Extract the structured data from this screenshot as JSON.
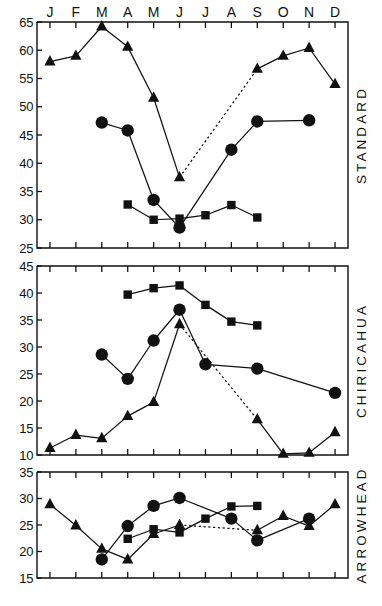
{
  "figure": {
    "months": [
      "J",
      "F",
      "M",
      "A",
      "M",
      "J",
      "J",
      "A",
      "S",
      "O",
      "N",
      "D"
    ],
    "month_axis_position": "top"
  },
  "chart_data": [
    {
      "type": "line",
      "title": "STANDARD",
      "panel_label": "STANDARD",
      "xlabel": "",
      "ylabel": "",
      "categories": [
        "J",
        "F",
        "M",
        "A",
        "M",
        "J",
        "J",
        "A",
        "S",
        "O",
        "N",
        "D"
      ],
      "ylim": [
        25,
        65
      ],
      "yticks": [
        25,
        30,
        35,
        40,
        45,
        50,
        55,
        60,
        65
      ],
      "grid": false,
      "legend": "none",
      "series": [
        {
          "name": "triangle",
          "marker": "triangle",
          "x": [
            "J",
            "F",
            "M",
            "A",
            "M",
            "J",
            "S",
            "O",
            "N",
            "D"
          ],
          "values": [
            58.0,
            59.0,
            64.2,
            60.6,
            51.6,
            37.5,
            56.7,
            59.0,
            60.4,
            54.0
          ],
          "dashed_segments": [
            [
              "J",
              "S"
            ]
          ]
        },
        {
          "name": "circle",
          "marker": "circle",
          "x": [
            "M",
            "A",
            "M",
            "J",
            "J",
            "A",
            "S",
            "O",
            "N",
            "D"
          ],
          "values": [
            47.2,
            45.8,
            33.5,
            28.6,
            null,
            42.4,
            47.4,
            null,
            47.6,
            null
          ]
        },
        {
          "name": "square",
          "marker": "square",
          "x": [
            "A",
            "M",
            "J",
            "J",
            "A",
            "S"
          ],
          "values": [
            32.7,
            30.0,
            30.2,
            30.8,
            32.6,
            30.4
          ]
        }
      ]
    },
    {
      "type": "line",
      "title": "CHIRICAHUA",
      "panel_label": "CHIRICAHUA",
      "xlabel": "",
      "ylabel": "",
      "categories": [
        "J",
        "F",
        "M",
        "A",
        "M",
        "J",
        "J",
        "A",
        "S",
        "O",
        "N",
        "D"
      ],
      "ylim": [
        10,
        45
      ],
      "yticks": [
        10,
        15,
        20,
        25,
        30,
        35,
        40,
        45
      ],
      "grid": false,
      "legend": "none",
      "series": [
        {
          "name": "triangle",
          "marker": "triangle",
          "x": [
            "J",
            "F",
            "M",
            "A",
            "M",
            "J",
            "S",
            "O",
            "N",
            "D"
          ],
          "values": [
            11.3,
            13.7,
            13.1,
            17.2,
            19.8,
            34.2,
            16.6,
            10.2,
            10.4,
            14.2
          ],
          "dashed_segments": [
            [
              "J",
              "S"
            ]
          ]
        },
        {
          "name": "circle",
          "marker": "circle",
          "x": [
            "M",
            "A",
            "M",
            "J",
            "J",
            "A",
            "S",
            "D"
          ],
          "values": [
            28.6,
            24.1,
            31.2,
            36.9,
            26.8,
            null,
            26.0,
            21.5
          ]
        },
        {
          "name": "square",
          "marker": "square",
          "x": [
            "A",
            "M",
            "J",
            "J",
            "A",
            "S"
          ],
          "values": [
            39.7,
            40.9,
            41.4,
            37.8,
            34.7,
            34.0
          ]
        }
      ]
    },
    {
      "type": "line",
      "title": "ARROWHEAD",
      "panel_label": "ARROWHEAD",
      "xlabel": "",
      "ylabel": "",
      "categories": [
        "J",
        "F",
        "M",
        "A",
        "M",
        "J",
        "J",
        "A",
        "S",
        "O",
        "N",
        "D"
      ],
      "ylim": [
        15,
        35
      ],
      "yticks": [
        15,
        20,
        25,
        30,
        35
      ],
      "grid": false,
      "legend": "none",
      "series": [
        {
          "name": "triangle",
          "marker": "triangle",
          "x": [
            "J",
            "F",
            "M",
            "A",
            "M",
            "J",
            "S",
            "O",
            "N",
            "D"
          ],
          "values": [
            28.9,
            24.9,
            20.5,
            18.5,
            23.3,
            25.0,
            24.0,
            26.7,
            24.8,
            28.9
          ],
          "dashed_segments": [
            [
              "J",
              "S"
            ]
          ]
        },
        {
          "name": "circle",
          "marker": "circle",
          "x": [
            "M",
            "A",
            "M",
            "J",
            "J",
            "A",
            "S",
            "N",
            "D"
          ],
          "values": [
            18.5,
            24.8,
            28.6,
            30.1,
            null,
            26.2,
            22.1,
            26.2,
            null
          ]
        },
        {
          "name": "square",
          "marker": "square",
          "x": [
            "A",
            "M",
            "J",
            "J",
            "A",
            "S"
          ],
          "values": [
            22.4,
            24.2,
            23.6,
            26.2,
            28.5,
            28.6
          ]
        }
      ]
    }
  ]
}
